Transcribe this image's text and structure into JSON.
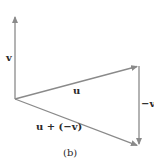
{
  "diagram": {
    "caption": "(b)",
    "colors": {
      "vector": "#8a8a8a",
      "text": "#2a2a2a",
      "background": "#ffffff"
    },
    "points": {
      "origin": [
        15,
        99
      ],
      "v_tip": [
        15,
        15
      ],
      "u_tip": [
        139,
        66
      ],
      "sum_tip": [
        139,
        146
      ]
    },
    "vectors": [
      {
        "id": "v",
        "label": "v",
        "from": "origin",
        "to": "v_tip"
      },
      {
        "id": "u",
        "label": "u",
        "from": "origin",
        "to": "u_tip"
      },
      {
        "id": "neg-v",
        "label": "−v",
        "from": "u_tip",
        "to": "sum_tip"
      },
      {
        "id": "u-plus-neg-v",
        "label": "u + (−v)",
        "from": "origin",
        "to": "sum_tip"
      }
    ],
    "labels": {
      "v": "v",
      "u": "u",
      "neg_v": "−v",
      "u_plus_neg_v": "u + (−v)"
    }
  }
}
